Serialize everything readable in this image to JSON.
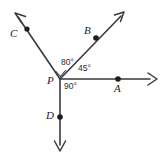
{
  "figure": {
    "type": "geometry-diagram",
    "background_color": "#ffffff",
    "line_color": "#3a3a3c",
    "label_color": "#1d1d1f"
  },
  "vertex": {
    "label": "P",
    "x": 60,
    "y": 79,
    "label_x": 47,
    "label_y": 84
  },
  "rays": [
    {
      "id": "ray-pc",
      "endpoint_label": "C",
      "direction": "up-left",
      "from_x": 60,
      "from_y": 79,
      "to_x": 15,
      "to_y": 13,
      "dot_x": 27,
      "dot_y": 29,
      "label_x": 10,
      "label_y": 37
    },
    {
      "id": "ray-pb",
      "endpoint_label": "B",
      "direction": "up-right",
      "from_x": 60,
      "from_y": 79,
      "to_x": 124,
      "to_y": 12,
      "dot_x": 96,
      "dot_y": 38,
      "label_x": 84,
      "label_y": 34
    },
    {
      "id": "ray-pa",
      "endpoint_label": "A",
      "direction": "right",
      "from_x": 60,
      "from_y": 79,
      "to_x": 156,
      "to_y": 79,
      "dot_x": 118,
      "dot_y": 79,
      "label_x": 114,
      "label_y": 92
    },
    {
      "id": "ray-pd",
      "endpoint_label": "D",
      "direction": "down",
      "from_x": 60,
      "from_y": 79,
      "to_x": 60,
      "to_y": 151,
      "dot_x": 60,
      "dot_y": 117,
      "label_x": 46,
      "label_y": 119
    }
  ],
  "angles": [
    {
      "id": "angle-cpb",
      "value": "80°",
      "between": "C and B",
      "label_x": 61,
      "label_y": 65
    },
    {
      "id": "angle-bpa",
      "value": "45°",
      "between": "B and A",
      "label_x": 78,
      "label_y": 71
    },
    {
      "id": "angle-apd",
      "value": "90°",
      "between": "A and D",
      "label_x": 64,
      "label_y": 89
    }
  ]
}
